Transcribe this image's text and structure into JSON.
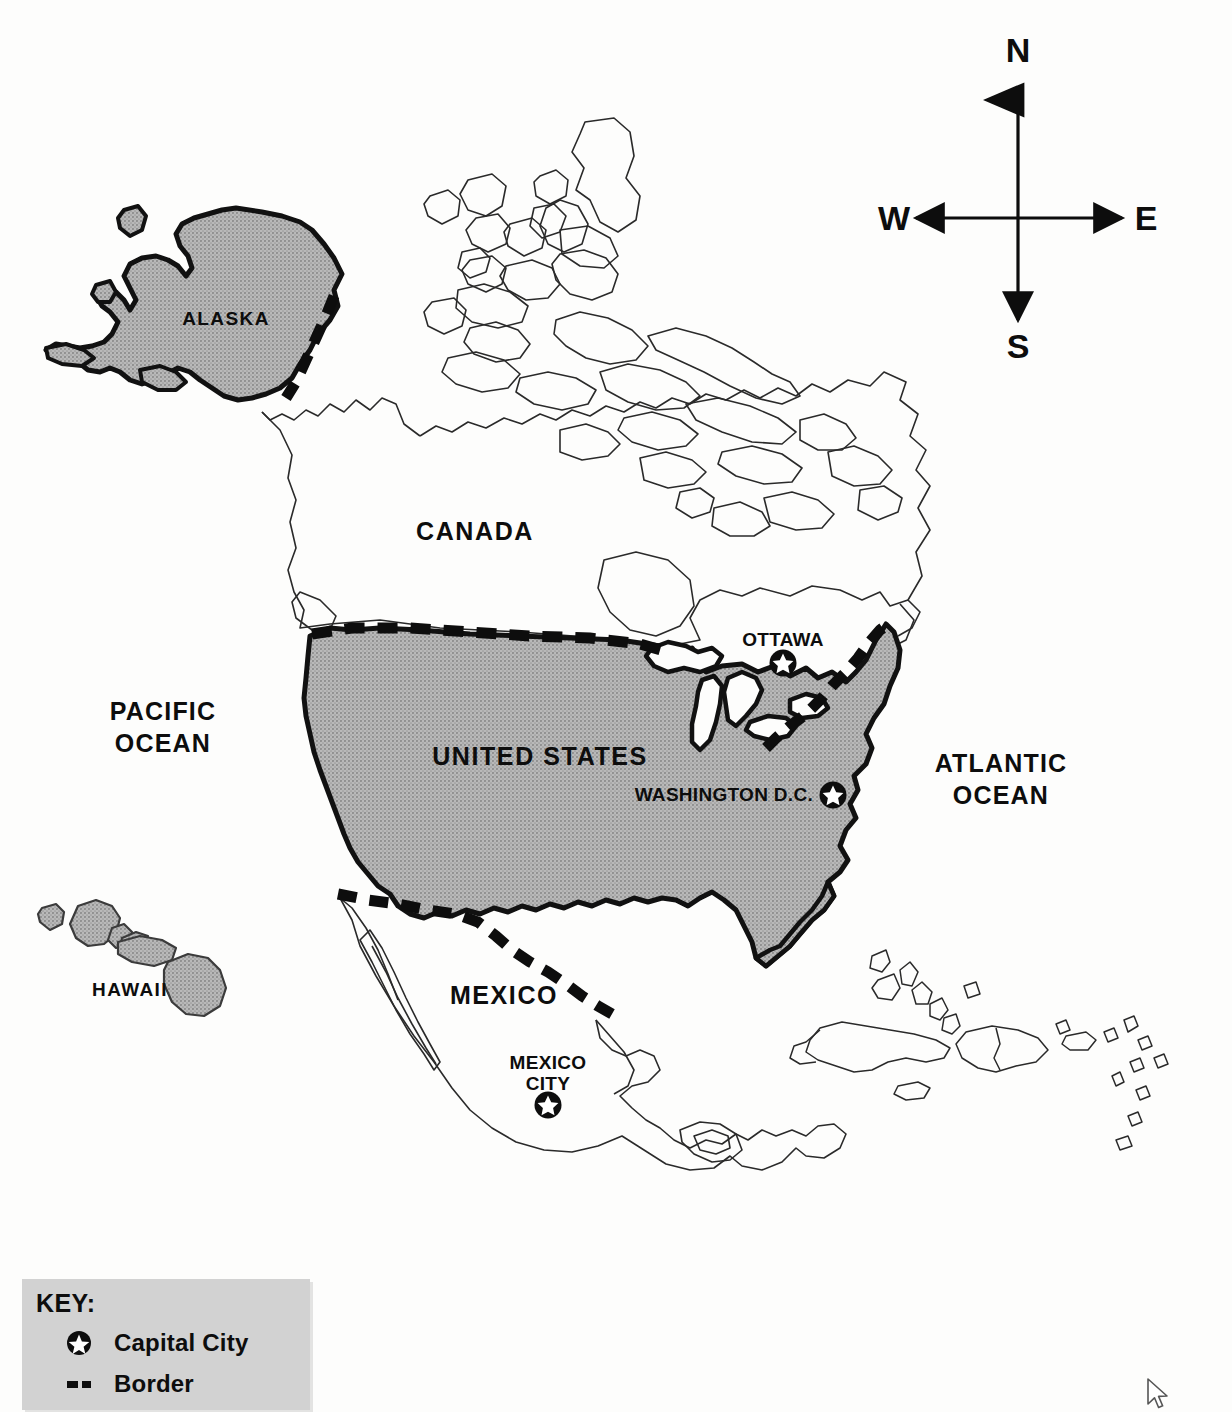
{
  "page": {
    "background_color": "#fdfdfc"
  },
  "colors": {
    "land_fill": "#b0b0b0",
    "highlight_fill": "#b4b4b4",
    "outline": "#111111",
    "thin_outline": "#2a2a2a",
    "label_text": "#0d0d0d",
    "key_background": "#d2d2d2"
  },
  "compass": {
    "name": "compass-rose",
    "north": "N",
    "east": "E",
    "south": "S",
    "west": "W"
  },
  "country_labels": [
    {
      "id": "canada",
      "text": "CANADA",
      "x": 475,
      "y": 540
    },
    {
      "id": "united-states",
      "text": "UNITED STATES",
      "x": 540,
      "y": 765
    },
    {
      "id": "mexico",
      "text": "MEXICO",
      "x": 504,
      "y": 1004
    }
  ],
  "state_labels": [
    {
      "id": "alaska",
      "text": "ALASKA",
      "x": 226,
      "y": 325
    },
    {
      "id": "hawaii",
      "text": "HAWAII",
      "x": 130,
      "y": 996
    }
  ],
  "ocean_labels": [
    {
      "id": "pacific-ocean",
      "line1": "PACIFIC",
      "line2": "OCEAN",
      "x": 163,
      "y": 720
    },
    {
      "id": "atlantic-ocean",
      "line1": "ATLANTIC",
      "line2": "OCEAN",
      "x": 1001,
      "y": 772
    }
  ],
  "capitals": [
    {
      "id": "ottawa",
      "name": "OTTAWA",
      "label_x": 783,
      "label_y": 646,
      "star_x": 783,
      "star_y": 662,
      "label_position": "above"
    },
    {
      "id": "washington-dc",
      "name": "WASHINGTON D.C.",
      "label_x": 748,
      "label_y": 797,
      "star_x": 833,
      "star_y": 795,
      "label_position": "left"
    },
    {
      "id": "mexico-city",
      "name_line1": "MEXICO",
      "name_line2": "CITY",
      "label_x": 548,
      "label_y": 1063,
      "star_x": 548,
      "star_y": 1102,
      "label_position": "above"
    }
  ],
  "key": {
    "title": "KEY:",
    "items": [
      {
        "id": "capital-city",
        "symbol": "star-in-circle",
        "label": "Capital City"
      },
      {
        "id": "border",
        "symbol": "dashed-line",
        "label": "Border"
      }
    ]
  },
  "cursor": {
    "name": "mouse-cursor",
    "x": 1146,
    "y": 1378
  }
}
